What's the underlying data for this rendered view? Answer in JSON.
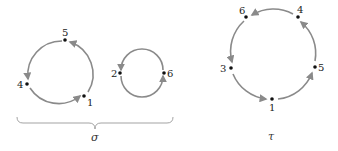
{
  "diagram": {
    "type": "permutation-cycle-diagram",
    "colors": {
      "arc": "#8a8a8a",
      "point": "#111111",
      "brace": "#999999"
    },
    "sigma": {
      "label": "σ",
      "cycles": [
        {
          "points": [
            "5",
            "4",
            "1"
          ],
          "direction": "5 → 4 → 1 → 5"
        },
        {
          "points": [
            "2",
            "6"
          ],
          "direction": "2 → 6 → 2"
        }
      ]
    },
    "tau": {
      "label": "τ",
      "cycles": [
        {
          "points": [
            "6",
            "3",
            "1",
            "5",
            "4"
          ],
          "direction": "6 → 3 → 1 → 5 → 4 → 6"
        }
      ]
    }
  }
}
